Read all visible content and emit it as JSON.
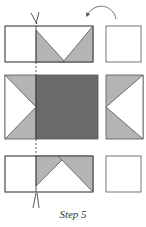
{
  "caption": "Step 5",
  "colors": {
    "outline": "#555555",
    "light_gray": "#b4b4b4",
    "dark_gray": "#6a6a6a",
    "white": "#ffffff",
    "cut_line": "#444444"
  },
  "rows": [
    {
      "name": "top-row",
      "pieces": [
        "flying-geese-unit",
        "plain-square"
      ]
    },
    {
      "name": "middle-row",
      "pieces": [
        "side-geese-unit-left",
        "center-square",
        "side-geese-unit-right"
      ]
    },
    {
      "name": "bottom-row",
      "pieces": [
        "flying-geese-unit",
        "plain-square"
      ]
    }
  ],
  "annotations": {
    "arrow": "curved-rotate-arrow",
    "cut_line": "dashed-cut-line",
    "scissors": 2
  }
}
